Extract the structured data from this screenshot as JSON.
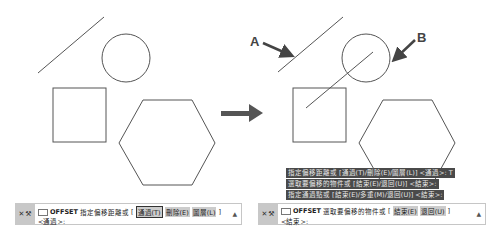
{
  "labels": {
    "a": "A",
    "b": "B"
  },
  "left_panel": {
    "command_line": {
      "command": "OFFSET",
      "prompt": "指定偏移距離或",
      "bracket_open": "[",
      "options": [
        "通過(T)",
        "刪除(E)",
        "圖層(L)"
      ],
      "bracket_close": "]",
      "default": "<通過>:",
      "highlighted_option": "通過(T)"
    }
  },
  "right_panel": {
    "history": [
      "指定偏移距離或 [通過(T)/刪除(E)/圖層(L)] <通過>: T",
      "選取要偏移的物件或 [結束(E)/退回(U)] <結束>:",
      "指定通過點或 [結束(E)/多重(M)/退回(U)] <結束>:"
    ],
    "command_line": {
      "command": "OFFSET",
      "prompt": "選取要偏移的物件或",
      "bracket_open": "[",
      "options": [
        "結束(E)",
        "退回(U)"
      ],
      "bracket_close": "]",
      "default": "<結束>:"
    }
  },
  "icons": {
    "close": "✕",
    "wrench": "⚒",
    "scroll_up": "▲"
  },
  "colors": {
    "shape_stroke": "#555555",
    "history_bg": "#4a4a4a",
    "grip_bg": "#c8c8c8"
  }
}
